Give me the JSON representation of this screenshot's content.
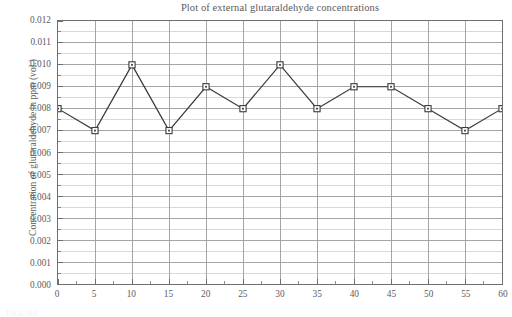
{
  "chart_data": {
    "type": "line",
    "title": "Plot of external glutaraldehyde concentrations",
    "xlabel": "",
    "ylabel": "Concentration of glutaraldehyde in ppm (vol.)",
    "x": [
      0,
      5,
      10,
      15,
      20,
      25,
      30,
      35,
      40,
      45,
      50,
      55,
      60
    ],
    "values": [
      0.008,
      0.007,
      0.01,
      0.007,
      0.009,
      0.008,
      0.01,
      0.008,
      0.009,
      0.009,
      0.008,
      0.007,
      0.008
    ],
    "xlim": [
      0,
      60
    ],
    "ylim": [
      0.0,
      0.012
    ],
    "xticks": [
      0,
      5,
      10,
      15,
      20,
      25,
      30,
      35,
      40,
      45,
      50,
      55,
      60
    ],
    "xtick_labels": [
      "0",
      "5",
      "10",
      "15",
      "20",
      "25",
      "30",
      "35",
      "40",
      "45",
      "50",
      "55",
      "60"
    ],
    "x_minor_step": 2.5,
    "yticks": [
      0.0,
      0.001,
      0.002,
      0.003,
      0.004,
      0.005,
      0.006,
      0.007,
      0.008,
      0.009,
      0.01,
      0.011,
      0.012
    ],
    "ytick_labels": [
      "0.000",
      "0.001",
      "0.002",
      "0.003",
      "0.004",
      "0.005",
      "0.006",
      "0.007",
      "0.008",
      "0.009",
      "0.010",
      "0.011",
      "0.012"
    ],
    "y_minor_step": 0.0005,
    "grid": true,
    "legend": null,
    "marker": "open-square",
    "colors": {
      "line": "#3a3a3c",
      "marker_face": "#ffffff",
      "marker_edge": "#3a3a3c",
      "major_grid": "#9a9a9d",
      "minor_grid": "#cfcfd1",
      "axis": "#6d6e70",
      "text": "#5b5b5d",
      "background": "#ffffff"
    }
  },
  "caption": {
    "cropped_text": "FIGURE"
  }
}
